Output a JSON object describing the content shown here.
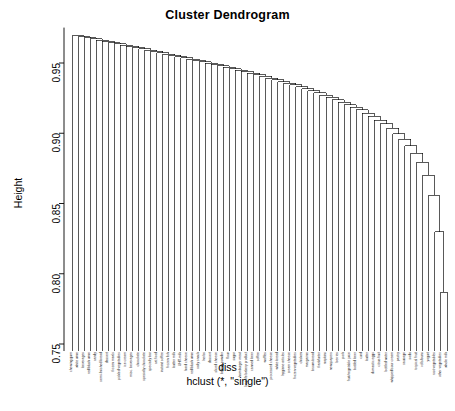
{
  "title": "Cluster Dendrogram",
  "ylabel": "Height",
  "xlabel_line1": "diss",
  "xlabel_line2": "hclust (*, \"single\")",
  "axis": {
    "ticks": [
      0.75,
      0.8,
      0.85,
      0.9,
      0.95
    ],
    "tick_labels": [
      "0.75",
      "0.80",
      "0.85",
      "0.90",
      "0.95"
    ],
    "range": [
      0.745,
      0.972
    ]
  },
  "chart_data": {
    "type": "dendrogram",
    "title": "Cluster Dendrogram",
    "xlabel": "diss",
    "ylabel": "Height",
    "method": "single",
    "subtitle": "hclust (*, \"single\")",
    "ylim": [
      0.745,
      0.972
    ],
    "grid": false,
    "legend": "none",
    "n_leaves": 60,
    "leaf_labels": [
      "chewing gum",
      "white wine",
      "beverages",
      "red/blush wine",
      "candy",
      "semi-finished bread",
      "dessert",
      "frozen meals",
      "pickled vegetables",
      "ice cream",
      "misc. beverages",
      "chocolate",
      "specialty chocolate",
      "specialty bar",
      "cat food",
      "instant coffee",
      "frozen fish",
      "butter milk",
      "UHT-milk",
      "hard cheese",
      "red/blush wine",
      "salty snack",
      "herbs",
      "dessert",
      "sliced cheese",
      "baking powder",
      "flour",
      "sugar",
      "hamburger meat",
      "long life bakery product",
      "canned beer",
      "coffee",
      "waffles",
      "processed cheese",
      "white bread",
      "hygiene articles",
      "cream cheese",
      "frozen vegetables",
      "chicken",
      "margarine",
      "brown bread",
      "frankfurter",
      "napkins",
      "newspapers",
      "berries",
      "pork",
      "fruit/vegetable juice",
      "bottled beer",
      "curd",
      "butter",
      "domestic eggs",
      "citrus fruit",
      "bottled water",
      "whipped/sour cream",
      "pastry",
      "sausage",
      "soda",
      "tropical fruit",
      "rolls/buns",
      "yogurt",
      "root vegetables",
      "other vegetables",
      "whole milk"
    ],
    "merge_heights": [
      0.9695,
      0.9688,
      0.9681,
      0.9672,
      0.9663,
      0.9654,
      0.9645,
      0.9636,
      0.9627,
      0.9618,
      0.9609,
      0.96,
      0.9591,
      0.9582,
      0.9573,
      0.9564,
      0.9555,
      0.9546,
      0.9537,
      0.9528,
      0.9519,
      0.951,
      0.95,
      0.949,
      0.948,
      0.947,
      0.946,
      0.945,
      0.944,
      0.9428,
      0.9416,
      0.9404,
      0.9392,
      0.938,
      0.9368,
      0.9356,
      0.9344,
      0.933,
      0.9316,
      0.9302,
      0.9288,
      0.9272,
      0.9256,
      0.924,
      0.9222,
      0.9204,
      0.9186,
      0.9166,
      0.9144,
      0.912,
      0.9094,
      0.9066,
      0.9034,
      0.8998,
      0.8958,
      0.8912,
      0.8858,
      0.8792,
      0.87,
      0.856,
      0.83,
      0.787
    ]
  }
}
